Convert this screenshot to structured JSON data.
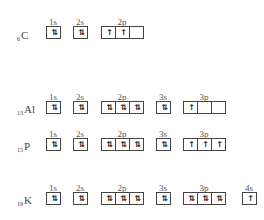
{
  "rows": [
    {
      "subscript": "6",
      "symbol": "C",
      "orbitals": [
        {
          "label": "1s",
          "boxes": [
            "⇅"
          ]
        },
        {
          "label": "2s",
          "boxes": [
            "⇅"
          ]
        },
        {
          "label": "2p",
          "boxes": [
            "↑",
            "↑",
            ""
          ]
        }
      ]
    },
    {
      "subscript": "13",
      "symbol": "Al",
      "orbitals": [
        {
          "label": "1s",
          "boxes": [
            "⇅"
          ]
        },
        {
          "label": "2s",
          "boxes": [
            "⇅"
          ]
        },
        {
          "label": "2p",
          "boxes": [
            "⇅",
            "⇅",
            "⇅"
          ]
        },
        {
          "label": "3s",
          "boxes": [
            "⇅"
          ]
        },
        {
          "label": "3p",
          "boxes": [
            "↑",
            "",
            ""
          ]
        }
      ]
    },
    {
      "subscript": "15",
      "symbol": "P",
      "orbitals": [
        {
          "label": "1s",
          "boxes": [
            "⇅"
          ]
        },
        {
          "label": "2s",
          "boxes": [
            "⇅"
          ]
        },
        {
          "label": "2p",
          "boxes": [
            "⇅",
            "⇅",
            "⇅"
          ]
        },
        {
          "label": "3s",
          "boxes": [
            "⇅"
          ]
        },
        {
          "label": "3p",
          "boxes": [
            "↑",
            "↑",
            "↑"
          ]
        }
      ]
    },
    {
      "subscript": "19",
      "symbol": "K",
      "orbitals": [
        {
          "label": "1s",
          "boxes": [
            "⇅"
          ]
        },
        {
          "label": "2s",
          "boxes": [
            "⇅"
          ]
        },
        {
          "label": "2p",
          "boxes": [
            "⇅",
            "⇅",
            "⇅"
          ]
        },
        {
          "label": "3s",
          "boxes": [
            "⇅"
          ]
        },
        {
          "label": "3p",
          "boxes": [
            "⇅",
            "⇅",
            "⇅"
          ]
        },
        {
          "label": "4s",
          "boxes": [
            "↑"
          ]
        }
      ]
    }
  ]
}
